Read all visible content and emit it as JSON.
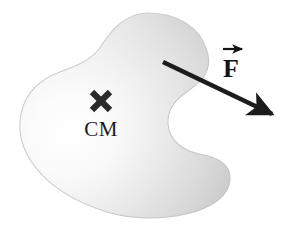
{
  "figure": {
    "background_color": "#ffffff",
    "width": 289,
    "height": 230
  },
  "body_shape": {
    "name": "irregular-rigid-body",
    "description": "Shaded irregular blob representing a rigid body",
    "fill_light": "#fdfdfd",
    "fill_mid": "#d9d9d9",
    "fill_dark": "#bdbdbd",
    "outline_color": "#c2c2c2",
    "highlight_center": {
      "x": 70,
      "y": 140
    }
  },
  "center_of_mass": {
    "marker_glyph": "×",
    "marker_name": "cross-marker",
    "label": "CM",
    "marker_position": {
      "x": 101,
      "y": 101
    },
    "label_position": {
      "x": 101,
      "y": 130
    },
    "color": "#2a2a2a"
  },
  "force_vector": {
    "label": "F",
    "vector_accent": "arrow-over",
    "label_position": {
      "x": 232,
      "y": 72
    },
    "color": "#1c1c1c",
    "tail": {
      "x": 163,
      "y": 62
    },
    "tip": {
      "x": 277,
      "y": 117
    },
    "line_width": 4.5,
    "arrowhead_length": 26,
    "arrowhead_width": 17
  },
  "icons": {
    "cross_marker": "cross-marker-icon",
    "force_arrow": "force-arrow-icon",
    "vector_hat": "vector-arrow-accent-icon"
  }
}
